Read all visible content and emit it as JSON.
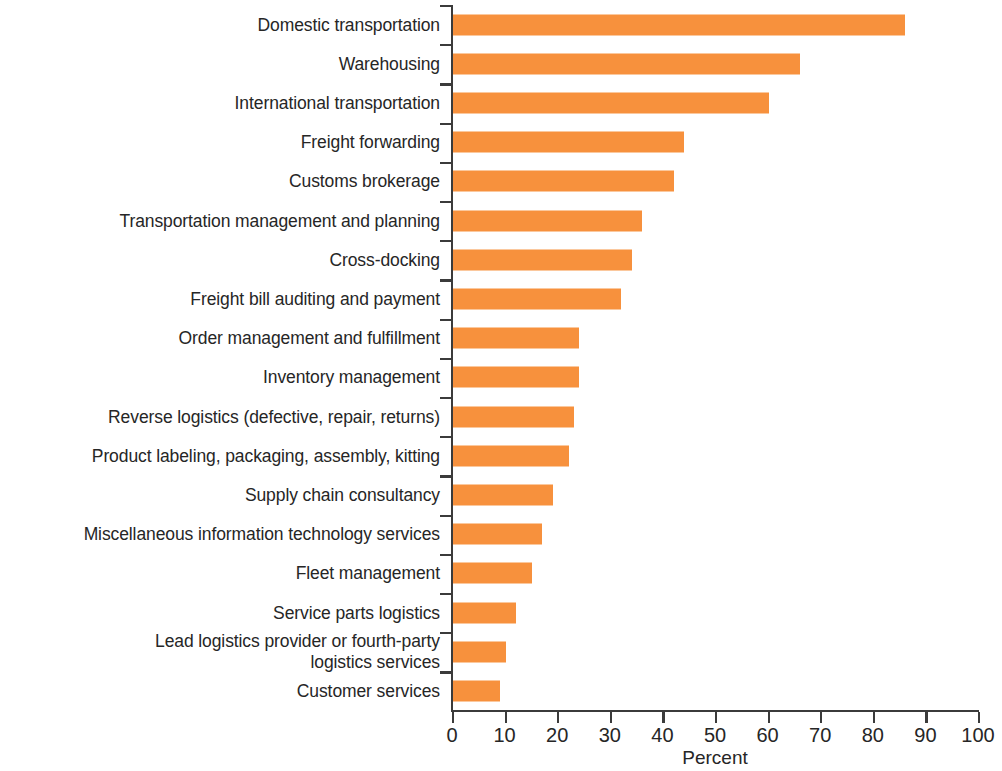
{
  "chart_data": {
    "type": "bar",
    "orientation": "horizontal",
    "title": "",
    "subtitle": "",
    "xlabel": "Percent",
    "ylabel": "",
    "xlim": [
      0,
      100
    ],
    "ylim": null,
    "grid": false,
    "legend": null,
    "bar_color": "#f7913d",
    "axis_color": "#3b3b3b",
    "text_color": "#262626",
    "xticks": [
      0,
      10,
      20,
      30,
      40,
      50,
      60,
      70,
      80,
      90,
      100
    ],
    "xtick_labels": [
      "0",
      "10",
      "20",
      "30",
      "40",
      "50",
      "60",
      "70",
      "80",
      "90",
      "100"
    ],
    "categories": [
      "Domestic transportation",
      "Warehousing",
      "International transportation",
      "Freight forwarding",
      "Customs brokerage",
      "Transportation management and planning",
      "Cross-docking",
      "Freight bill auditing and payment",
      "Order management and fulfillment",
      "Inventory management",
      "Reverse logistics (defective, repair, returns)",
      "Product labeling, packaging, assembly, kitting",
      "Supply chain consultancy",
      "Miscellaneous information technology services",
      "Fleet management",
      "Service parts logistics",
      "Lead logistics provider or fourth-party\nlogistics services",
      "Customer services"
    ],
    "values": [
      86,
      66,
      60,
      44,
      42,
      36,
      34,
      32,
      24,
      24,
      23,
      22,
      19,
      17,
      15,
      12,
      10,
      9
    ]
  }
}
